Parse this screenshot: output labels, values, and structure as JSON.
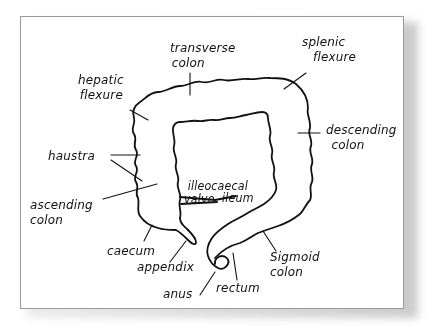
{
  "diagram": {
    "colors": {
      "ink": "#111111",
      "card_background": "#ffffff",
      "card_border": "#9a9a9a",
      "shadow": "#bdbdbd"
    },
    "labels": {
      "transverse_colon": {
        "line1": "transverse",
        "line2": "colon"
      },
      "splenic_flexure": {
        "line1": "splenic",
        "line2": "flexure"
      },
      "hepatic_flexure": {
        "line1": "hepatic",
        "line2": "flexure"
      },
      "descending_colon": {
        "line1": "descending",
        "line2": "colon"
      },
      "haustra": "haustra",
      "illeocaecal_valve": {
        "line1": "illeocaecal",
        "line2": "valve"
      },
      "ileum": "ileum",
      "ascending_colon": {
        "line1": "ascending",
        "line2": "colon"
      },
      "caecum": "caecum",
      "appendix": "appendix",
      "sigmoid_colon": {
        "line1": "Sigmoid",
        "line2": "colon"
      },
      "anus": "anus",
      "rectum": "rectum"
    }
  }
}
